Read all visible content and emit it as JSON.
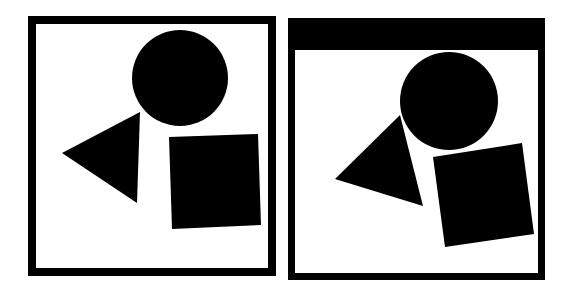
{
  "canvas": {
    "width": 571,
    "height": 295,
    "background": "#ffffff",
    "ink": "#000000"
  },
  "panels": [
    {
      "name": "left-panel",
      "frame": {
        "outer": [
          28,
          16,
          276,
          276
        ],
        "border": {
          "top": 8,
          "right": 8,
          "bottom": 8,
          "left": 8
        }
      },
      "shapes": {
        "circle": {
          "cx": 180,
          "cy": 78,
          "r": 48
        },
        "triangle": [
          [
            62,
            153
          ],
          [
            140,
            112
          ],
          [
            137,
            203
          ]
        ],
        "square": [
          [
            169,
            137
          ],
          [
            258,
            134
          ],
          [
            261,
            225
          ],
          [
            172,
            229
          ]
        ]
      }
    },
    {
      "name": "right-panel",
      "frame": {
        "outer": [
          288,
          18,
          545,
          280
        ],
        "border": {
          "top": 32,
          "right": 7,
          "bottom": 7,
          "left": 7
        }
      },
      "shapes": {
        "circle": {
          "cx": 449,
          "cy": 101,
          "r": 49
        },
        "triangle": [
          [
            335,
            179
          ],
          [
            400,
            115
          ],
          [
            423,
            206
          ]
        ],
        "square": [
          [
            433,
            157
          ],
          [
            522,
            143
          ],
          [
            534,
            234
          ],
          [
            445,
            247
          ]
        ]
      }
    }
  ]
}
